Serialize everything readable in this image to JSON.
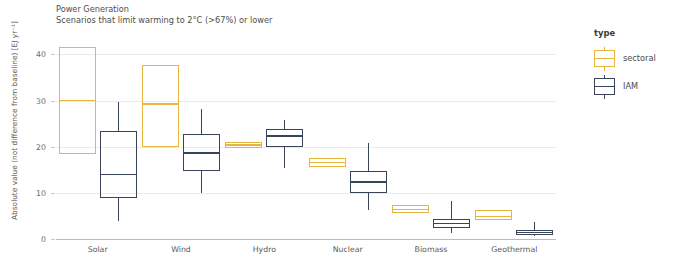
{
  "title": {
    "line1": "Power Generation",
    "line2": "Scenarios that limit warming to 2°C (>67%) or lower"
  },
  "legend": {
    "title": "type",
    "items": [
      {
        "label": "sectoral",
        "color": "#E8B63C",
        "name": "legend-item-sectoral"
      },
      {
        "label": "IAM",
        "color": "#3A4458",
        "name": "legend-item-iam"
      }
    ]
  },
  "chart_data": {
    "type": "box",
    "title": "Power Generation",
    "subtitle": "Scenarios that limit warming to 2°C (>67%) or lower",
    "xlabel": "",
    "ylabel": "Absolute value (not difference from baseline) [EJ yr⁻¹]",
    "ylim": [
      0,
      44
    ],
    "yticks": [
      0,
      10,
      20,
      30,
      40
    ],
    "ytick_labels": [
      "0",
      "10",
      "20",
      "30",
      "40"
    ],
    "grid": true,
    "legend_position": "right",
    "categories": [
      "Solar",
      "Wind",
      "Hydro",
      "Nuclear",
      "Biomass",
      "Geothermal"
    ],
    "series": [
      {
        "name": "sectoral",
        "color": "#E8B63C",
        "boxes": [
          {
            "category": "Solar",
            "whisker_low": 18.5,
            "q1": 18.5,
            "median": 30.0,
            "q3": 41.7,
            "whisker_high": 41.7
          },
          {
            "category": "Wind",
            "whisker_low": 20.0,
            "q1": 20.0,
            "median": 29.3,
            "q3": 37.8,
            "whisker_high": 37.8
          },
          {
            "category": "Hydro",
            "whisker_low": 19.8,
            "q1": 19.8,
            "median": 20.4,
            "q3": 21.0,
            "whisker_high": 21.0
          },
          {
            "category": "Nuclear",
            "whisker_low": 15.5,
            "q1": 15.5,
            "median": 16.6,
            "q3": 17.6,
            "whisker_high": 17.6
          },
          {
            "category": "Biomass",
            "whisker_low": 5.7,
            "q1": 5.7,
            "median": 6.4,
            "q3": 7.4,
            "whisker_high": 7.4
          },
          {
            "category": "Geothermal",
            "whisker_low": 4.2,
            "q1": 4.2,
            "median": 4.9,
            "q3": 6.3,
            "whisker_high": 6.3
          }
        ]
      },
      {
        "name": "IAM",
        "color": "#3A4458",
        "boxes": [
          {
            "category": "Solar",
            "whisker_low": 3.8,
            "q1": 8.9,
            "median": 14.0,
            "q3": 23.4,
            "whisker_high": 29.6
          },
          {
            "category": "Wind",
            "whisker_low": 10.0,
            "q1": 14.8,
            "median": 18.6,
            "q3": 22.8,
            "whisker_high": 28.1
          },
          {
            "category": "Hydro",
            "whisker_low": 15.3,
            "q1": 20.0,
            "median": 22.4,
            "q3": 23.8,
            "whisker_high": 25.7
          },
          {
            "category": "Nuclear",
            "whisker_low": 6.2,
            "q1": 10.0,
            "median": 12.4,
            "q3": 14.8,
            "whisker_high": 20.9
          },
          {
            "category": "Biomass",
            "whisker_low": 1.3,
            "q1": 2.3,
            "median": 3.4,
            "q3": 4.4,
            "whisker_high": 8.3
          },
          {
            "category": "Geothermal",
            "whisker_low": 0.6,
            "q1": 0.8,
            "median": 1.4,
            "q3": 1.9,
            "whisker_high": 3.6
          }
        ]
      }
    ]
  }
}
